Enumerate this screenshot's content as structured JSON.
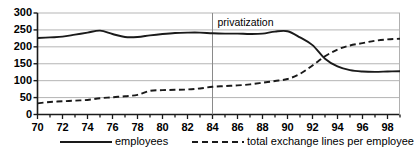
{
  "chart_data": {
    "type": "line",
    "title": "",
    "xlabel": "",
    "ylabel": "",
    "xlim": [
      70,
      99
    ],
    "ylim": [
      0,
      300
    ],
    "grid": true,
    "legend_position": "bottom",
    "yticks": [
      300,
      250,
      200,
      150,
      100,
      50,
      0
    ],
    "xticks": [
      70,
      72,
      74,
      76,
      78,
      80,
      82,
      84,
      86,
      88,
      90,
      92,
      94,
      96,
      98
    ],
    "xtick_minor_step": 1,
    "x": [
      70,
      71,
      72,
      73,
      74,
      75,
      76,
      77,
      78,
      79,
      80,
      81,
      82,
      83,
      84,
      85,
      86,
      87,
      88,
      89,
      90,
      91,
      92,
      93,
      94,
      95,
      96,
      97,
      98,
      99
    ],
    "annotations": [
      {
        "text": "privatization",
        "x": 84,
        "type": "vertical-line-with-label"
      }
    ],
    "series": [
      {
        "name": "employees",
        "style": "solid",
        "color": "#1a1a1a",
        "values": [
          226,
          228,
          230,
          236,
          242,
          248,
          238,
          229,
          229,
          234,
          238,
          241,
          242,
          242,
          240,
          239,
          239,
          238,
          239,
          245,
          246,
          228,
          205,
          165,
          142,
          131,
          127,
          126,
          127,
          128
        ]
      },
      {
        "name": "total exchange lines per employee",
        "style": "dashed",
        "color": "#1a1a1a",
        "values": [
          33,
          37,
          39,
          41,
          43,
          48,
          51,
          54,
          58,
          70,
          72,
          73,
          74,
          77,
          82,
          84,
          86,
          89,
          94,
          99,
          105,
          120,
          145,
          172,
          192,
          204,
          211,
          218,
          222,
          224
        ]
      }
    ]
  },
  "legend": {
    "items": [
      {
        "label": "employees",
        "style": "solid"
      },
      {
        "label": "total exchange lines per employee",
        "style": "dashed"
      }
    ]
  }
}
